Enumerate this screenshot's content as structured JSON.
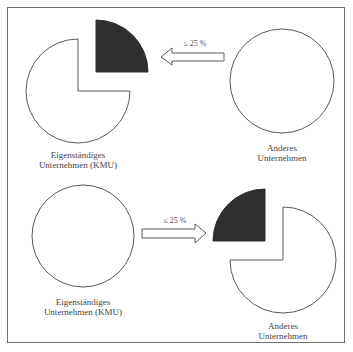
{
  "diagram": {
    "colors": {
      "stroke": "#5a5a5a",
      "dark_share": "#2f2f2f",
      "background": "#ffffff"
    },
    "top_scenario": {
      "left_entity": {
        "label_line1": "Eigenständiges",
        "label_line2": "Unternehmen (KMU)",
        "shape": "pie-three-quarters-with-detached-quarter"
      },
      "arrow": {
        "direction": "left",
        "label": "≤ 25 %"
      },
      "right_entity": {
        "label_line1": "Anderes",
        "label_line2": "Unternehmen",
        "shape": "circle"
      }
    },
    "bottom_scenario": {
      "left_entity": {
        "label_line1": "Eigenständiges",
        "label_line2": "Unternehmen (KMU)",
        "shape": "circle"
      },
      "arrow": {
        "direction": "right",
        "label": "≤ 25 %"
      },
      "right_entity": {
        "label_line1": "Anderes",
        "label_line2": "Unternehmen",
        "shape": "pie-three-quarters-with-detached-quarter"
      }
    }
  }
}
